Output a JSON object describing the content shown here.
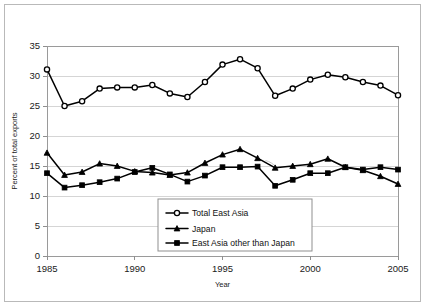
{
  "chart_data": {
    "type": "line",
    "title": "",
    "xlabel": "Year",
    "ylabel": "Percent of total exports",
    "xlim": [
      1985,
      2005
    ],
    "ylim": [
      0,
      35
    ],
    "ytick_labels": [
      "0",
      "5",
      "10",
      "15",
      "20",
      "25",
      "30",
      "35"
    ],
    "yticks": [
      0,
      5,
      10,
      15,
      20,
      25,
      30,
      35
    ],
    "xtick_labels": [
      "1985",
      "1990",
      "1995",
      "2000",
      "2005"
    ],
    "xticks": [
      1985,
      1990,
      1995,
      2000,
      2005
    ],
    "grid": "horizontal",
    "legend_position": "lower-center",
    "x": [
      1985,
      1986,
      1987,
      1988,
      1989,
      1990,
      1991,
      1992,
      1993,
      1994,
      1995,
      1996,
      1997,
      1998,
      1999,
      2000,
      2001,
      2002,
      2003,
      2004,
      2005
    ],
    "series": [
      {
        "name": "Total East Asia",
        "marker": "open-diamond",
        "values": [
          31.1,
          25.0,
          25.8,
          27.9,
          28.1,
          28.1,
          28.5,
          27.1,
          26.5,
          29.0,
          31.9,
          32.8,
          31.3,
          26.7,
          27.9,
          29.4,
          30.2,
          29.8,
          29.0,
          28.4,
          26.8
        ]
      },
      {
        "name": "Japan",
        "marker": "filled-triangle",
        "values": [
          17.2,
          13.5,
          14.0,
          15.4,
          15.0,
          14.1,
          13.9,
          13.5,
          13.9,
          15.5,
          16.9,
          17.8,
          16.3,
          14.7,
          15.0,
          15.3,
          16.2,
          14.8,
          14.3,
          13.3,
          12.0
        ]
      },
      {
        "name": "East Asia other than Japan",
        "marker": "filled-square",
        "values": [
          13.8,
          11.4,
          11.8,
          12.3,
          12.9,
          14.0,
          14.7,
          13.6,
          12.4,
          13.4,
          14.8,
          14.8,
          14.9,
          11.7,
          12.7,
          13.8,
          13.8,
          14.8,
          14.4,
          14.8,
          14.4
        ]
      }
    ]
  },
  "legend": {
    "entries": [
      {
        "label": "Total East Asia"
      },
      {
        "label": "Japan"
      },
      {
        "label": "East Asia other than Japan"
      }
    ]
  }
}
